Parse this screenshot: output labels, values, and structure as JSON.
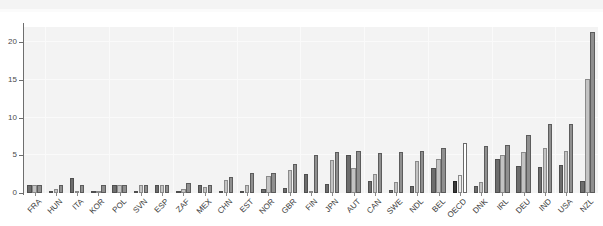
{
  "chart_data": {
    "type": "bar",
    "title": "",
    "subtitle": "",
    "xlabel": "",
    "ylabel": "",
    "ylim": [
      0,
      22
    ],
    "yticks": [
      0,
      5,
      10,
      15,
      20
    ],
    "ytick_labels": [
      "0",
      "5",
      "10",
      "15",
      "20"
    ],
    "grid": true,
    "legend": "none",
    "orientation": "vertical",
    "grouping": "grouped",
    "bars_per_group": 3,
    "sorted": "ascending",
    "highlight_category": "OECD",
    "categories": [
      "FRA",
      "HUN",
      "ITA",
      "KOR",
      "POL",
      "SVN",
      "ESP",
      "ZAF",
      "MEX",
      "CHN",
      "EST",
      "NOR",
      "GBR",
      "FIN",
      "JPN",
      "AUT",
      "CAN",
      "SWE",
      "NDL",
      "BEL",
      "OECD",
      "DNK",
      "IRL",
      "DEU",
      "IND",
      "USA",
      "NZL"
    ],
    "series": [
      {
        "name": "series-1",
        "color": "#6d6d6d",
        "values": [
          1.0,
          0.1,
          2.0,
          0.1,
          1.0,
          0.1,
          1.0,
          0.1,
          1.0,
          0.3,
          0.3,
          0.5,
          0.7,
          2.5,
          1.2,
          5.0,
          1.6,
          0.4,
          0.9,
          3.3,
          1.6,
          0.9,
          4.5,
          3.6,
          3.4,
          3.7,
          1.6
        ]
      },
      {
        "name": "series-2",
        "color": "#c3c3c3",
        "values": [
          1.0,
          0.5,
          0.1,
          0.1,
          1.0,
          1.0,
          1.0,
          0.5,
          0.8,
          1.7,
          1.1,
          2.2,
          3.0,
          0.1,
          4.4,
          3.3,
          2.5,
          1.5,
          4.2,
          4.5,
          2.4,
          1.4,
          5.0,
          5.4,
          6.0,
          5.6,
          15.1
        ]
      },
      {
        "name": "series-3",
        "color": "#8f8f8f",
        "values": [
          1.0,
          1.1,
          1.0,
          1.0,
          1.0,
          1.0,
          1.0,
          1.3,
          1.0,
          2.1,
          2.7,
          2.6,
          3.8,
          5.0,
          5.5,
          5.6,
          5.3,
          5.5,
          5.6,
          6.0,
          6.6,
          6.2,
          6.3,
          7.7,
          9.1,
          9.1,
          21.3
        ]
      }
    ]
  }
}
